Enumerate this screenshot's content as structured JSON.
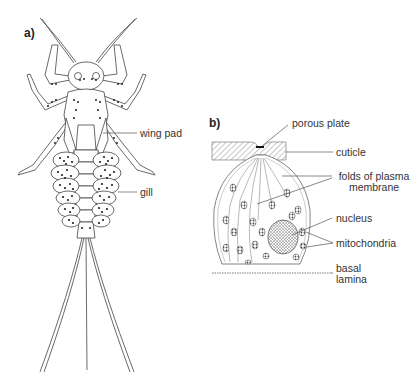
{
  "panel_a": {
    "letter": "a)",
    "labels": {
      "wing_pad": "wing pad",
      "gill": "gill"
    }
  },
  "panel_b": {
    "letter": "b)",
    "labels": {
      "porous_plate": "porous plate",
      "cuticle": "cuticle",
      "folds_line1": "folds of plasma",
      "folds_line2": "membrane",
      "nucleus": "nucleus",
      "mitochondria": "mitochondria",
      "basal_line1": "basal",
      "basal_line2": "lamina"
    }
  },
  "colors": {
    "line": "#444444",
    "text": "#333333",
    "fill": "#ffffff",
    "dot": "#222222"
  }
}
